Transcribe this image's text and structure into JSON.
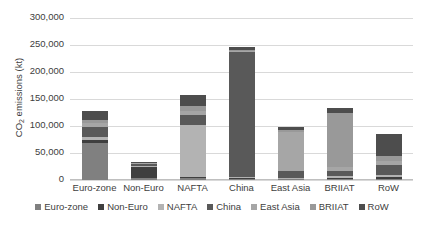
{
  "chart_data": {
    "type": "bar",
    "subtype": "stacked-column",
    "title": "",
    "xlabel": "",
    "ylabel": "CO2 emissions (kt)",
    "ylabel_rich": {
      "prefix": "CO",
      "sub": "2",
      "suffix": " emissions (kt)"
    },
    "ylim": [
      0,
      300000
    ],
    "ytick_step": 50000,
    "ytick_labels": [
      "300,000",
      "250,000",
      "200,000",
      "150,000",
      "100,000",
      "50,000",
      "0"
    ],
    "ytick_values": [
      300000,
      250000,
      200000,
      150000,
      100000,
      50000,
      0
    ],
    "grid": true,
    "legend_position": "bottom",
    "categories": [
      "Euro-zone",
      "Non-Euro",
      "NAFTA",
      "China",
      "East Asia",
      "BRIIAT",
      "RoW"
    ],
    "series": [
      {
        "name": "Euro-zone",
        "color": "#808080",
        "values": [
          68000,
          3500,
          4000,
          2000,
          1500,
          2500,
          2500
        ]
      },
      {
        "name": "Non-Euro",
        "color": "#3f3f3f",
        "values": [
          7000,
          21000,
          2500,
          1500,
          1000,
          2000,
          3500
        ]
      },
      {
        "name": "NAFTA",
        "color": "#b3b3b3",
        "values": [
          5000,
          1500,
          96000,
          2500,
          2000,
          3000,
          4000
        ]
      },
      {
        "name": "China",
        "color": "#595959",
        "values": [
          19000,
          3500,
          18000,
          231000,
          12000,
          10000,
          17000
        ]
      },
      {
        "name": "East Asia",
        "color": "#a6a6a6",
        "values": [
          6500,
          1500,
          7000,
          1500,
          72000,
          6000,
          9000
        ]
      },
      {
        "name": "BRIIAT",
        "color": "#999999",
        "values": [
          6500,
          1500,
          9500,
          3000,
          4500,
          101000,
          9000
        ]
      },
      {
        "name": "RoW",
        "color": "#4d4d4d",
        "values": [
          15000,
          1500,
          20000,
          5500,
          6000,
          8500,
          40000
        ]
      }
    ],
    "totals": [
      127000,
      34000,
      157000,
      247000,
      99000,
      133000,
      85000
    ]
  },
  "legend": {
    "items": [
      {
        "label": "Euro-zone",
        "color": "#808080"
      },
      {
        "label": "Non-Euro",
        "color": "#3f3f3f"
      },
      {
        "label": "NAFTA",
        "color": "#b3b3b3"
      },
      {
        "label": "China",
        "color": "#595959"
      },
      {
        "label": "East Asia",
        "color": "#a6a6a6"
      },
      {
        "label": "BRIIAT",
        "color": "#999999"
      },
      {
        "label": "RoW",
        "color": "#4d4d4d"
      }
    ]
  },
  "style": {
    "gridline_color": "#d9d9d9",
    "axis_color": "#bfbfbf",
    "text_color": "#404040",
    "background": "#ffffff"
  }
}
